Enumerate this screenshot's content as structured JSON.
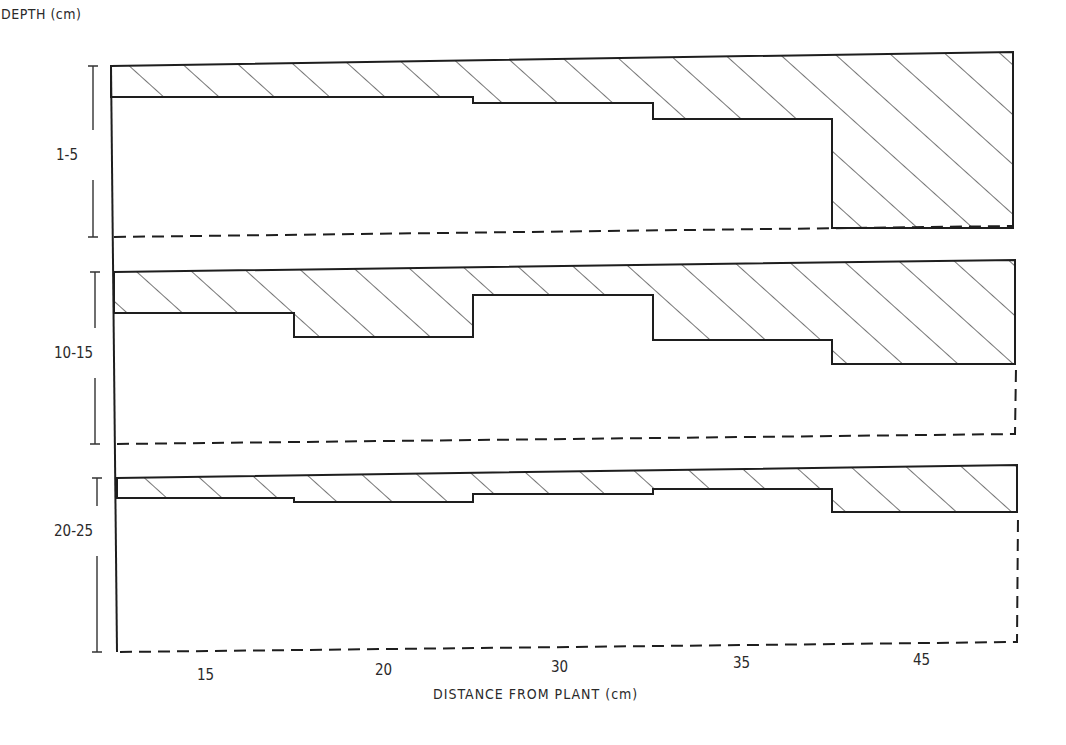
{
  "chart_data": {
    "type": "area",
    "title": "",
    "ylabel": "DEPTH (cm)",
    "xlabel": "DISTANCE FROM PLANT (cm)",
    "categories": [
      "15",
      "20",
      "30",
      "35",
      "45"
    ],
    "x_tick_px": [
      206,
      384,
      560,
      742,
      922
    ],
    "segment_edges_px": [
      116,
      294,
      473,
      653,
      832,
      1015
    ],
    "grid": false,
    "legend": null,
    "series": [
      {
        "name": "1-5",
        "top_y": [
          66,
          63,
          60,
          57,
          53
        ],
        "band_bottom_y": [
          97,
          97,
          103,
          119,
          228
        ],
        "baseline_y": [
          237,
          234,
          232,
          230,
          226
        ],
        "relative_hatched_fraction": [
          0.18,
          0.2,
          0.25,
          0.36,
          1.0
        ]
      },
      {
        "name": "10-15",
        "top_y": [
          272,
          270,
          268,
          266,
          261
        ],
        "band_bottom_y": [
          313,
          337,
          295,
          340,
          364
        ],
        "baseline_y": [
          444,
          442,
          440,
          437,
          434
        ],
        "relative_hatched_fraction": [
          0.24,
          0.39,
          0.16,
          0.43,
          0.59
        ]
      },
      {
        "name": "20-25",
        "top_y": [
          478,
          476,
          474,
          471,
          466
        ],
        "band_bottom_y": [
          498,
          502,
          494,
          489,
          512
        ],
        "baseline_y": [
          652,
          650,
          648,
          645,
          642
        ],
        "relative_hatched_fraction": [
          0.12,
          0.15,
          0.12,
          0.1,
          0.26
        ]
      }
    ]
  },
  "labels": {
    "ylabel": "DEPTH (cm)",
    "xlabel": "DISTANCE FROM PLANT (cm)",
    "rows": [
      "1-5",
      "10-15",
      "20-25"
    ],
    "ticks": [
      "15",
      "20",
      "30",
      "35",
      "45"
    ]
  }
}
